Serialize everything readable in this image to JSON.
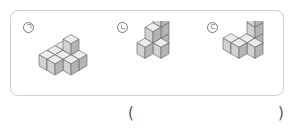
{
  "question": {
    "options": [
      {
        "label": "ㄱ",
        "name": "figure-a"
      },
      {
        "label": "ㄴ",
        "name": "figure-b"
      },
      {
        "label": "ㄷ",
        "name": "figure-c"
      }
    ],
    "answer_open": "(",
    "answer_close": ")",
    "answer_value": ""
  },
  "colors": {
    "top": "#ececec",
    "left": "#d2d2d2",
    "right": "#b4b4b4",
    "stroke": "#6f6f6f",
    "border": "#cfcfcf"
  }
}
